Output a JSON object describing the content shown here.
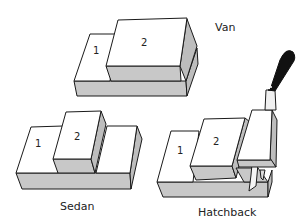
{
  "diagram": {
    "vehicles": [
      {
        "name": "Van",
        "box_labels": [
          "1",
          "2"
        ]
      },
      {
        "name": "Sedan",
        "box_labels": [
          "1",
          "2"
        ]
      },
      {
        "name": "Hatchback",
        "box_labels": [
          "1",
          "2"
        ],
        "extra": "knife-cutting-third-box"
      }
    ]
  },
  "labels": {
    "van": "Van",
    "sedan": "Sedan",
    "hatchback": "Hatchback",
    "van_box1": "1",
    "van_box2": "2",
    "sedan_box1": "1",
    "sedan_box2": "2",
    "hatch_box1": "1",
    "hatch_box2": "2"
  },
  "colors": {
    "background": "#ffffff",
    "face_light": "#ffffff",
    "face_shaded": "#c0c0c0",
    "outline": "#1a1a1a",
    "knife_handle": "#111111"
  }
}
